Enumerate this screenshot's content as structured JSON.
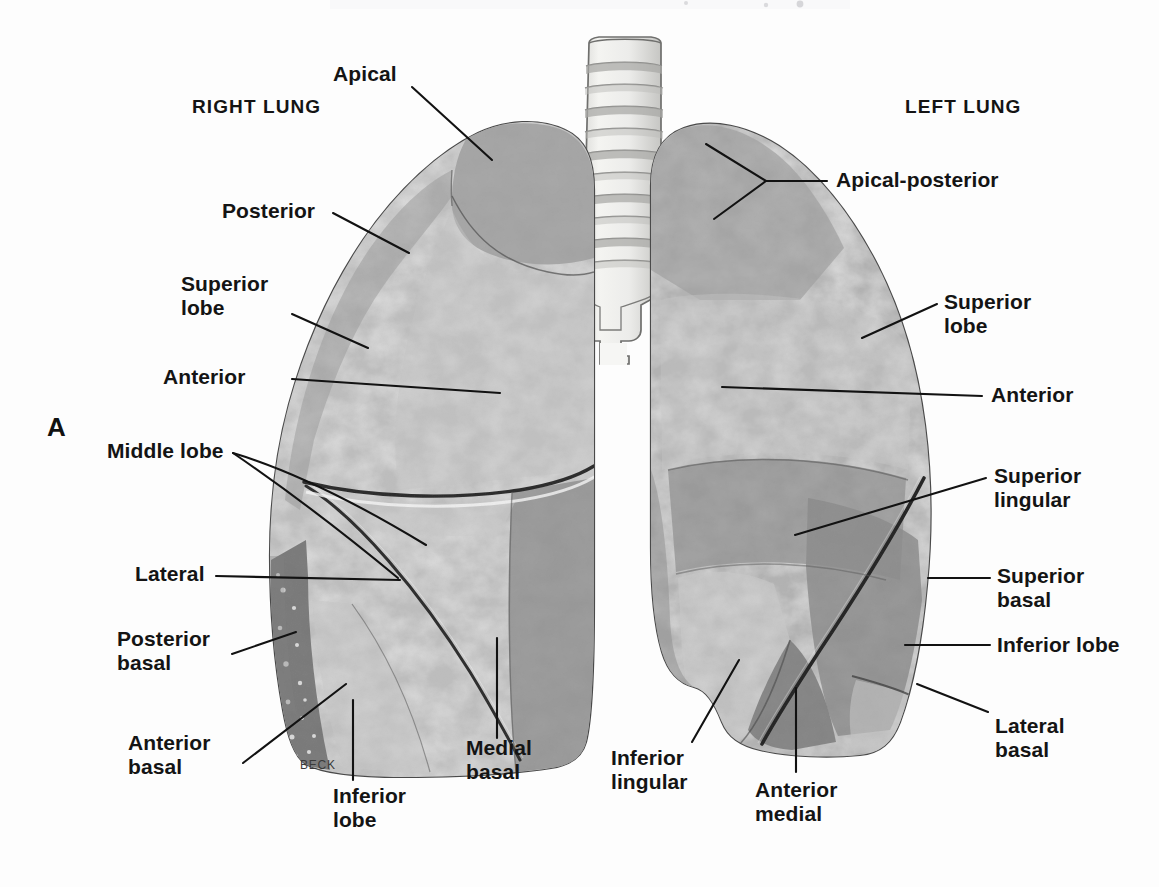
{
  "figure": {
    "panel_letter": "A",
    "artist_signature": "BECK",
    "top_cropped_text": ". , . g"
  },
  "headings": {
    "right_lung": "RIGHT LUNG",
    "left_lung": "LEFT LUNG"
  },
  "right_lung_labels": {
    "apical": "Apical",
    "posterior": "Posterior",
    "superior_lobe": "Superior\nlobe",
    "anterior": "Anterior",
    "middle_lobe": "Middle lobe",
    "lateral": "Lateral",
    "posterior_basal": "Posterior\nbasal",
    "anterior_basal": "Anterior\nbasal",
    "inferior_lobe": "Inferior\nlobe",
    "medial_basal": "Medial\nbasal"
  },
  "left_lung_labels": {
    "apical_posterior": "Apical-posterior",
    "superior_lobe": "Superior\nlobe",
    "anterior": "Anterior",
    "superior_lingular": "Superior\nlingular",
    "superior_basal": "Superior\nbasal",
    "inferior_lobe": "Inferior lobe",
    "lateral_basal": "Lateral\nbasal",
    "inferior_lingular": "Inferior\nlingular",
    "anterior_medial": "Anterior\nmedial"
  },
  "colors": {
    "background": "#fdfdfd",
    "ink": "#141414",
    "tissue_light": "#c8c8c8",
    "tissue_mid": "#a8a8a8",
    "tissue_dark": "#8a8a8a",
    "tissue_darker": "#6e6e6e",
    "outline": "#3a3a3a",
    "trachea_light": "#f0f0ee",
    "trachea_ring": "#9a9a98"
  }
}
